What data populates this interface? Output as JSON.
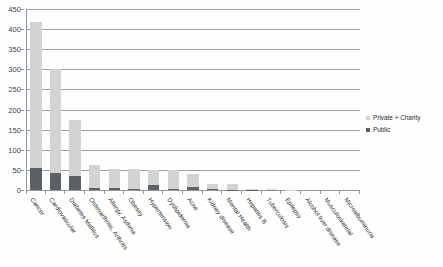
{
  "chart_data": {
    "type": "bar",
    "subtype": "stacked-vertical",
    "title": "",
    "subtitle": "",
    "xlabel": "",
    "ylabel": "",
    "ylim": [
      0,
      450
    ],
    "ytick_step": 50,
    "yticks": [
      "0",
      "50",
      "100",
      "150",
      "200",
      "250",
      "300",
      "350",
      "400",
      "450"
    ],
    "grid": true,
    "grid_axis": "y",
    "legend_position": "right",
    "categories": [
      "Cancer",
      "Cardiovascular",
      "Diabetes Mellitus",
      "Osteoarthritis, Arthritis",
      "Allergy, Asthma",
      "Obesity",
      "Hypertension",
      "Dyslipidemia",
      "Acne",
      "Kidney disease",
      "Mental Health",
      "Hepatitis B",
      "Tuberculosis",
      "Epilepsy",
      "Alcohol liver disease",
      "Musculoskeletal",
      "Microalbuminuria"
    ],
    "series": [
      {
        "name": "Public",
        "color": "#5e6164",
        "values": [
          55,
          42,
          36,
          5,
          5,
          2,
          12,
          3,
          8,
          2,
          1,
          1,
          0,
          0,
          0,
          0,
          0
        ]
      },
      {
        "name": "Private + Charity",
        "color": "#d3d3d3",
        "values": [
          363,
          258,
          139,
          57,
          48,
          50,
          38,
          48,
          31,
          12,
          13,
          2,
          2,
          1,
          0,
          0,
          0
        ]
      }
    ],
    "totals": [
      418,
      300,
      175,
      62,
      53,
      52,
      50,
      51,
      39,
      14,
      14,
      3,
      2,
      1,
      0,
      0,
      0
    ]
  },
  "legend": {
    "items": [
      {
        "label": "Private + Charity",
        "color": "#d3d3d3"
      },
      {
        "label": "Public",
        "color": "#5e6164"
      }
    ]
  },
  "colors": {
    "private_charity": "#d3d3d3",
    "public": "#5e6164",
    "gridline": "#9aa3ab",
    "axis": "#8f989f",
    "text": "#2b2b2b",
    "background": "#fefefe"
  }
}
